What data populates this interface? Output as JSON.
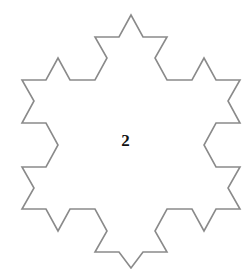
{
  "diagram": {
    "shape": "koch-snowflake-iteration-2",
    "label": "2",
    "stroke_color": "#8a8a8a",
    "fill_color": "#ffffff",
    "points": "131,15 119,37 95,37 107,58 95,80 70,80 58,58 46,80 22,80 34,101 22,123 46,123 58,145 46,167 22,167 34,188 22,209 46,209 58,231 70,209 95,209 107,231 95,252 119,252 131,268 143,252 167,252 155,231 167,209 192,209 204,231 216,209 240,209 228,188 240,167 216,167 204,145 216,123 240,123 228,101 240,80 216,80 204,58 192,80 167,80 155,58 167,37 143,37"
  }
}
